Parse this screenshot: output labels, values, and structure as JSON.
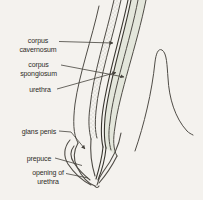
{
  "figure": {
    "background_color": "#f4f2ee",
    "line_color": "#4f4c46",
    "urethra_line_color": "#38362f",
    "spongiosum_shade_color": "#e3e6db",
    "stipple_dot_color": "#8f8c84",
    "text_color": "#2d2b27",
    "labels": [
      {
        "id": "corpus-cavernosum",
        "text": "corpus\ncavernosum"
      },
      {
        "id": "corpus-spongiosum",
        "text": "corpus\nspongiosum"
      },
      {
        "id": "urethra",
        "text": "urethra"
      },
      {
        "id": "glans-penis",
        "text": "glans penis"
      },
      {
        "id": "prepuce",
        "text": "prepuce"
      },
      {
        "id": "opening-of-urethra",
        "text": "opening of\nurethra"
      }
    ]
  }
}
